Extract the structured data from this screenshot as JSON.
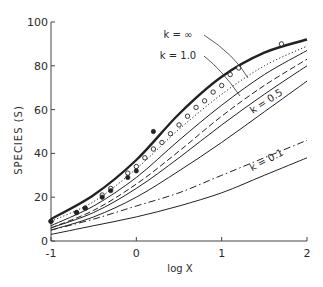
{
  "chart_data": {
    "type": "line",
    "title": "",
    "xlabel": "log X",
    "ylabel": "SPECIES (S)",
    "xlim": [
      -1,
      2
    ],
    "ylim": [
      0,
      100
    ],
    "grid": false,
    "legend_position": "inline annotations",
    "xticks": [
      -1,
      0,
      1,
      2
    ],
    "xtick_labels": [
      "-1",
      "0",
      "1",
      "2"
    ],
    "yticks": [
      0,
      20,
      40,
      60,
      80,
      100
    ],
    "ytick_labels": [
      "0",
      "20",
      "40",
      "60",
      "80",
      "100"
    ],
    "series": [
      {
        "name": "k = ∞",
        "style": "thick-solid",
        "x": [
          -1,
          -0.5,
          0,
          0.5,
          1,
          1.5,
          2
        ],
        "values": [
          10,
          21,
          37,
          58,
          75,
          86,
          92
        ]
      },
      {
        "name": "observed (dotted)",
        "style": "dotted",
        "x": [
          -1,
          -0.5,
          0,
          0.5,
          1,
          1.5,
          2
        ],
        "values": [
          9,
          18,
          33,
          51,
          67,
          80,
          89
        ]
      },
      {
        "name": "k = 1.0",
        "style": "solid",
        "x": [
          -1,
          -0.5,
          0,
          0.5,
          1,
          1.5,
          2
        ],
        "values": [
          7,
          16,
          29,
          46,
          62,
          76,
          87
        ]
      },
      {
        "name": "intermediate (dashed)",
        "style": "dashed",
        "x": [
          -1,
          -0.5,
          0,
          0.5,
          1,
          1.5,
          2
        ],
        "values": [
          6,
          14,
          26,
          41,
          57,
          71,
          83
        ]
      },
      {
        "name": "intermediate (solid)",
        "style": "solid",
        "x": [
          -1,
          -0.5,
          0,
          0.5,
          1,
          1.5,
          2
        ],
        "values": [
          6,
          13,
          24,
          38,
          53,
          67,
          80
        ]
      },
      {
        "name": "k = 0.5",
        "style": "solid",
        "x": [
          -1,
          -0.5,
          0,
          0.5,
          1,
          1.5,
          2
        ],
        "values": [
          5,
          11,
          20,
          32,
          45,
          59,
          73
        ]
      },
      {
        "name": "intermediate (dash-dot)",
        "style": "dash-dot",
        "x": [
          -1,
          -0.5,
          0,
          0.5,
          1,
          1.5,
          2
        ],
        "values": [
          5,
          10,
          16,
          22,
          30,
          38,
          46
        ]
      },
      {
        "name": "k = 0.1",
        "style": "solid",
        "x": [
          -1,
          -0.5,
          0,
          0.5,
          1,
          1.5,
          2
        ],
        "values": [
          3,
          7,
          11,
          16,
          22,
          30,
          38
        ]
      }
    ],
    "markers": {
      "open_circles": {
        "x": [
          -1,
          -0.7,
          -0.6,
          -0.4,
          -0.3,
          -0.1,
          0,
          0.1,
          0.2,
          0.3,
          0.4,
          0.5,
          0.6,
          0.7,
          0.8,
          0.9,
          1.0,
          1.1,
          1.2,
          1.7
        ],
        "values": [
          9,
          13,
          15,
          21,
          24,
          31,
          34,
          38,
          42,
          45,
          49,
          53,
          57,
          61,
          64,
          68,
          71,
          76,
          79,
          90
        ]
      },
      "filled_circles": {
        "x": [
          -1,
          -0.7,
          -0.6,
          -0.4,
          -0.3,
          -0.1,
          0,
          0.2
        ],
        "values": [
          9,
          13,
          15,
          20,
          23,
          29,
          32,
          50
        ]
      }
    },
    "annotations": [
      {
        "text": "k = ∞",
        "x": 0.9,
        "y": 84
      },
      {
        "text": "k = 1.0",
        "x": 0.9,
        "y": 76
      },
      {
        "text": "k = 0.5",
        "x": 1.35,
        "y": 52
      },
      {
        "text": "k = 0.1",
        "x": 1.35,
        "y": 28
      }
    ]
  }
}
